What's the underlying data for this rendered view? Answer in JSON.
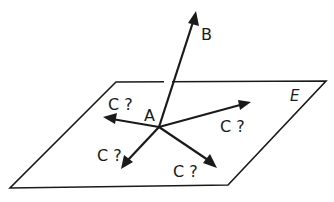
{
  "diagram": {
    "plane": {
      "label": "E",
      "vertices": [
        [
          116,
          82
        ],
        [
          326,
          81
        ],
        [
          228,
          185
        ],
        [
          10,
          188
        ]
      ]
    },
    "point_A": {
      "label": "A",
      "x": 159,
      "y": 127
    },
    "ray_B": {
      "label": "B",
      "to": [
        196,
        12
      ]
    },
    "rays_C": [
      {
        "label": "C ?",
        "to": [
          104,
          117
        ]
      },
      {
        "label": "C ?",
        "to": [
          250,
          102
        ]
      },
      {
        "label": "C ?",
        "to": [
          122,
          168
        ]
      },
      {
        "label": "C ?",
        "to": [
          216,
          167
        ]
      }
    ],
    "colors": {
      "ink": "#1a1a1a",
      "background": "#ffffff"
    }
  }
}
